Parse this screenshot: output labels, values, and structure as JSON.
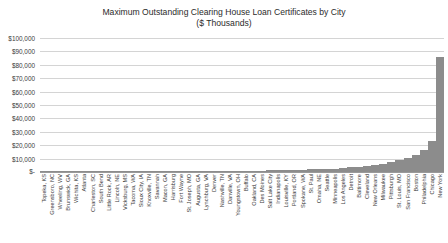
{
  "chart_data": {
    "type": "bar",
    "title": "Maximum Outstanding Clearing House Loan Certificates by City\n($ Thousands)",
    "title_line1": "Maximum Outstanding Clearing House Loan Certificates by City",
    "title_line2": "($ Thousands)",
    "xlabel": "",
    "ylabel": "",
    "ylim": [
      0,
      100000
    ],
    "ytick_values": [
      0,
      10000,
      20000,
      30000,
      40000,
      50000,
      60000,
      70000,
      80000,
      90000,
      100000
    ],
    "ytick_labels": [
      "$-",
      "$10,000",
      "$20,000",
      "$30,000",
      "$40,000",
      "$50,000",
      "$60,000",
      "$70,000",
      "$80,000",
      "$90,000",
      "$100,000"
    ],
    "grid": true,
    "legend": false,
    "bar_color": "#8c8c8c",
    "gridline_color": "#d4d4d4",
    "categories": [
      "Topeka, KS",
      "Greensboro, NC",
      "Wheeling, WV",
      "Brunswick, GA",
      "Wichita, KS",
      "Atlanta",
      "Charleston, SC",
      "South Bend",
      "Little Rock, AR",
      "Lincoln, NE",
      "Vicksburg, MS",
      "Tacoma, WA",
      "Sioux City, IA",
      "Knoxville, TN",
      "Savannah",
      "Macon, GA",
      "Harrisburg",
      "Fort Wayne",
      "St. Joseph, MO",
      "Augusta, GA",
      "Lynchburg, VA",
      "Denver",
      "Nashville, TN",
      "Danville, VA",
      "Youngstown, OH",
      "Buffalo",
      "Oakland, CA",
      "Des Moines",
      "Salt Lake City",
      "Indianapolis",
      "Louisville, KY",
      "Portland, OR",
      "Spokane, WA",
      "St. Paul",
      "Omaha, NE",
      "Seattle",
      "Minneapolis",
      "Los Angeles",
      "Detroit",
      "Baltimore",
      "Cleveland",
      "New Orleans",
      "Milwaukee",
      "Pittsburgh",
      "St. Louis, MO",
      "San Francisco",
      "Boston",
      "Philadelphia",
      "Chicago",
      "New York"
    ],
    "values": [
      40,
      55,
      70,
      85,
      100,
      120,
      140,
      160,
      180,
      200,
      225,
      250,
      275,
      300,
      330,
      360,
      400,
      440,
      480,
      520,
      570,
      620,
      680,
      740,
      800,
      880,
      960,
      1050,
      1150,
      1250,
      1400,
      1550,
      1700,
      1900,
      2100,
      2350,
      2600,
      3000,
      3400,
      3900,
      4500,
      5200,
      6000,
      7200,
      8600,
      10500,
      13000,
      16500,
      23000,
      86000
    ]
  }
}
